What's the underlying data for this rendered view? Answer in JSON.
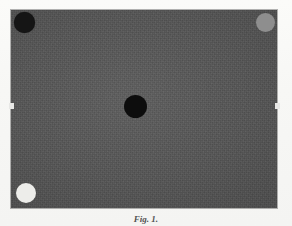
{
  "figure": {
    "panel": {
      "background_color": "#565656",
      "description": "noisy dark gray rectangular image panel"
    },
    "markers": [
      {
        "name": "marker-top-left",
        "position": "top-left",
        "tone": "dark",
        "color": "#151515",
        "cx": 24,
        "cy": 22,
        "diameter": 21
      },
      {
        "name": "marker-top-right",
        "position": "top-right",
        "tone": "mid-gray",
        "color": "#8e8e8e",
        "cx": 265,
        "cy": 22,
        "diameter": 19
      },
      {
        "name": "marker-center",
        "position": "center",
        "tone": "black",
        "color": "#0d0d0d",
        "cx": 135,
        "cy": 106,
        "diameter": 23
      },
      {
        "name": "marker-bottom-left",
        "position": "bottom-left",
        "tone": "white",
        "color": "#ededea",
        "cx": 25,
        "cy": 193,
        "diameter": 20
      }
    ],
    "edge_ticks": [
      {
        "name": "tick-left",
        "side": "left",
        "x": 9,
        "y": 103
      },
      {
        "name": "tick-right",
        "side": "right",
        "x": 277,
        "y": 103
      }
    ]
  },
  "caption": {
    "label": "Fig. 1.",
    "text": ""
  }
}
